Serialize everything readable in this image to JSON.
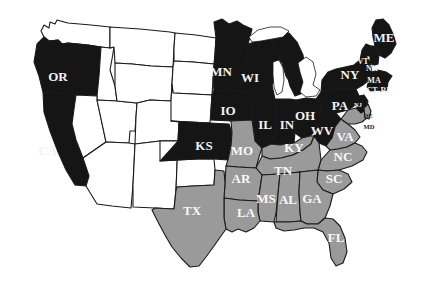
{
  "figure": {
    "kind": "choropleth-map",
    "region": "United States",
    "width": 423,
    "height": 293,
    "background_color": "#ffffff"
  },
  "colors": {
    "dark": "#151515",
    "mid": "#9a9a9a",
    "light": "#ffffff",
    "outline": "#1a1a1a",
    "label_on_dark": "#f2f2f2",
    "label_on_mid": "#f8f8f8",
    "label_on_light": "#1a1a1a"
  },
  "categories": [
    {
      "key": "dark",
      "color": "#151515"
    },
    {
      "key": "mid",
      "color": "#9a9a9a"
    },
    {
      "key": "light",
      "color": "#ffffff"
    }
  ],
  "states": [
    {
      "code": "WA",
      "label": "",
      "group": "light",
      "lx": 96,
      "ly": 35,
      "size": "sm"
    },
    {
      "code": "OR",
      "label": "OR",
      "group": "dark",
      "lx": 58,
      "ly": 78,
      "size": "lg"
    },
    {
      "code": "CA",
      "label": "CA",
      "group": "dark",
      "lx": 48,
      "ly": 152,
      "size": "lg"
    },
    {
      "code": "ID",
      "label": "",
      "group": "light",
      "lx": 103,
      "ly": 72,
      "size": "sm"
    },
    {
      "code": "NV",
      "label": "",
      "group": "light",
      "lx": 92,
      "ly": 127,
      "size": "sm"
    },
    {
      "code": "UT",
      "label": "",
      "group": "light",
      "lx": 121,
      "ly": 134,
      "size": "sm"
    },
    {
      "code": "AZ",
      "label": "",
      "group": "light",
      "lx": 112,
      "ly": 187,
      "size": "sm"
    },
    {
      "code": "MT",
      "label": "",
      "group": "light",
      "lx": 143,
      "ly": 52,
      "size": "sm"
    },
    {
      "code": "WY",
      "label": "",
      "group": "light",
      "lx": 145,
      "ly": 96,
      "size": "sm"
    },
    {
      "code": "CO",
      "label": "",
      "group": "light",
      "lx": 152,
      "ly": 141,
      "size": "sm"
    },
    {
      "code": "NM",
      "label": "",
      "group": "light",
      "lx": 151,
      "ly": 190,
      "size": "sm"
    },
    {
      "code": "ND",
      "label": "",
      "group": "light",
      "lx": 189,
      "ly": 51,
      "size": "sm"
    },
    {
      "code": "SD",
      "label": "",
      "group": "light",
      "lx": 190,
      "ly": 82,
      "size": "sm"
    },
    {
      "code": "NE",
      "label": "",
      "group": "light",
      "lx": 190,
      "ly": 110,
      "size": "sm"
    },
    {
      "code": "KS",
      "label": "KS",
      "group": "dark",
      "lx": 204,
      "ly": 147,
      "size": "lg"
    },
    {
      "code": "OK",
      "label": "",
      "group": "light",
      "lx": 196,
      "ly": 177,
      "size": "sm"
    },
    {
      "code": "TX",
      "label": "TX",
      "group": "mid",
      "lx": 192,
      "ly": 212,
      "size": "lg"
    },
    {
      "code": "MN",
      "label": "MN",
      "group": "dark",
      "lx": 221,
      "ly": 73,
      "size": "lg"
    },
    {
      "code": "IA",
      "label": "IO",
      "group": "dark",
      "lx": 228,
      "ly": 112,
      "size": "lg"
    },
    {
      "code": "MO",
      "label": "MO",
      "group": "mid",
      "lx": 242,
      "ly": 152,
      "size": "lg"
    },
    {
      "code": "AR",
      "label": "AR",
      "group": "mid",
      "lx": 241,
      "ly": 180,
      "size": "lg"
    },
    {
      "code": "LA",
      "label": "LA",
      "group": "mid",
      "lx": 246,
      "ly": 214,
      "size": "lg"
    },
    {
      "code": "WI",
      "label": "WI",
      "group": "dark",
      "lx": 250,
      "ly": 79,
      "size": "lg"
    },
    {
      "code": "IL",
      "label": "IL",
      "group": "dark",
      "lx": 265,
      "ly": 126,
      "size": "lg"
    },
    {
      "code": "MI",
      "label": "",
      "group": "dark",
      "lx": 283,
      "ly": 83,
      "size": "sm"
    },
    {
      "code": "IN",
      "label": "IN",
      "group": "dark",
      "lx": 287,
      "ly": 126,
      "size": "lg"
    },
    {
      "code": "KY",
      "label": "KY",
      "group": "mid",
      "lx": 294,
      "ly": 149,
      "size": "lg"
    },
    {
      "code": "TN",
      "label": "TN",
      "group": "mid",
      "lx": 283,
      "ly": 172,
      "size": "lg"
    },
    {
      "code": "MS",
      "label": "MS",
      "group": "mid",
      "lx": 266,
      "ly": 200,
      "size": "lg"
    },
    {
      "code": "AL",
      "label": "AL",
      "group": "mid",
      "lx": 288,
      "ly": 201,
      "size": "lg"
    },
    {
      "code": "GA",
      "label": "GA",
      "group": "mid",
      "lx": 312,
      "ly": 200,
      "size": "lg"
    },
    {
      "code": "FL",
      "label": "FL",
      "group": "mid",
      "lx": 336,
      "ly": 239,
      "size": "lg"
    },
    {
      "code": "OH",
      "label": "OH",
      "group": "dark",
      "lx": 305,
      "ly": 117,
      "size": "lg"
    },
    {
      "code": "WV",
      "label": "WV",
      "group": "dark",
      "lx": 322,
      "ly": 132,
      "size": "lg"
    },
    {
      "code": "VA",
      "label": "VA",
      "group": "mid",
      "lx": 345,
      "ly": 138,
      "size": "lg"
    },
    {
      "code": "NC",
      "label": "NC",
      "group": "mid",
      "lx": 343,
      "ly": 158,
      "size": "lg"
    },
    {
      "code": "SC",
      "label": "SC",
      "group": "mid",
      "lx": 334,
      "ly": 180,
      "size": "lg"
    },
    {
      "code": "PA",
      "label": "PA",
      "group": "dark",
      "lx": 340,
      "ly": 107,
      "size": "lg"
    },
    {
      "code": "NY",
      "label": "NY",
      "group": "dark",
      "lx": 350,
      "ly": 76,
      "size": "lg"
    },
    {
      "code": "ME",
      "label": "ME",
      "group": "dark",
      "lx": 384,
      "ly": 39,
      "size": "lg"
    },
    {
      "code": "VT",
      "label": "VT",
      "group": "dark",
      "lx": 363,
      "ly": 62,
      "size": "sm"
    },
    {
      "code": "NH",
      "label": "NH",
      "group": "dark",
      "lx": 372,
      "ly": 69,
      "size": "sm"
    },
    {
      "code": "MA",
      "label": "MA",
      "group": "dark",
      "lx": 374,
      "ly": 81,
      "size": "sm"
    },
    {
      "code": "CT",
      "label": "CT",
      "group": "dark",
      "lx": 372,
      "ly": 91,
      "size": "sm"
    },
    {
      "code": "RI",
      "label": "RI",
      "group": "dark",
      "lx": 385,
      "ly": 91,
      "size": "sm"
    },
    {
      "code": "NJ",
      "label": "NJ",
      "group": "dark",
      "lx": 358,
      "ly": 106,
      "size": "xs"
    },
    {
      "code": "DE",
      "label": "DE",
      "group": "dark",
      "lx": 365,
      "ly": 117,
      "size": "xs"
    },
    {
      "code": "MD",
      "label": "MD",
      "group": "mid",
      "lx": 366,
      "ly": 128,
      "size": "xs"
    }
  ]
}
